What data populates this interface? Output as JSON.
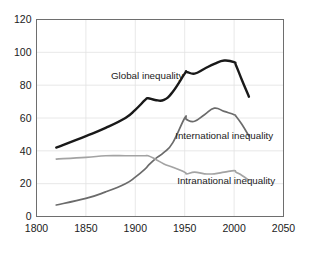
{
  "chart_data": {
    "type": "line",
    "title": "",
    "xlabel": "",
    "ylabel": "",
    "xlim": [
      1800,
      2050
    ],
    "ylim": [
      0,
      120
    ],
    "grid": true,
    "legend_position": "inline-labels",
    "x_ticks": [
      "1800",
      "1850",
      "1900",
      "1950",
      "2000",
      "2050"
    ],
    "y_ticks": [
      "0",
      "20",
      "40",
      "60",
      "80",
      "100",
      "120"
    ],
    "series": [
      {
        "name": "Global inequality",
        "color": "#191919",
        "label": "Global inequality",
        "x": [
          1820,
          1850,
          1870,
          1890,
          1900,
          1910,
          1913,
          1920,
          1929,
          1938,
          1950,
          1952,
          1960,
          1970,
          1980,
          1990,
          2000,
          2002,
          2008,
          2015
        ],
        "values": [
          42,
          49,
          54,
          60,
          65,
          71,
          72,
          71,
          71,
          76,
          87,
          88,
          87,
          90,
          93,
          95,
          94,
          92,
          83,
          73
        ]
      },
      {
        "name": "International inequality",
        "color": "#6b6b6b",
        "label": "International inequality",
        "x": [
          1820,
          1850,
          1870,
          1890,
          1900,
          1910,
          1913,
          1920,
          1929,
          1938,
          1950,
          1952,
          1960,
          1970,
          1980,
          1990,
          2000,
          2002,
          2008,
          2015
        ],
        "values": [
          7,
          11,
          15,
          20,
          24,
          29,
          31,
          35,
          39,
          45,
          60,
          59,
          58,
          62,
          66,
          64,
          62,
          61,
          56,
          49
        ]
      },
      {
        "name": "Intranational inequality",
        "color": "#a3a3a3",
        "label": "Intranational inequality",
        "x": [
          1820,
          1850,
          1870,
          1890,
          1900,
          1910,
          1913,
          1920,
          1929,
          1938,
          1950,
          1952,
          1960,
          1970,
          1980,
          1990,
          2000,
          2002,
          2008,
          2015
        ],
        "values": [
          35,
          36,
          37,
          37,
          37,
          37,
          37,
          35,
          32,
          30,
          27,
          26,
          27,
          26,
          26,
          27,
          28,
          27,
          25,
          22
        ]
      }
    ],
    "annotations": [
      {
        "text": "Global inequality",
        "x": 1912,
        "y": 84
      },
      {
        "text": "International inequality",
        "x": 1990,
        "y": 47
      },
      {
        "text": "Intranational inequality",
        "x": 1992,
        "y": 20
      }
    ]
  },
  "colors": {
    "global": "#191919",
    "international": "#6b6b6b",
    "intranational": "#a3a3a3",
    "grid": "#e2e2e2",
    "axis": "#6e6e6e",
    "text": "#1b1b1b",
    "background": "#ffffff"
  }
}
